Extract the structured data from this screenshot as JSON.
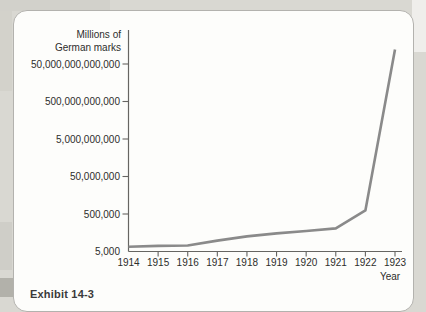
{
  "page": {
    "caption_fragment": "Exhibit 14-3"
  },
  "chart_data": {
    "type": "line",
    "title": "",
    "ylabel_line1": "Millions of",
    "ylabel_line2": "German marks",
    "xlabel": "Year",
    "y_scale": "log",
    "grid": false,
    "legend": "none",
    "x_tick_labels": [
      "1914",
      "1915",
      "1916",
      "1917",
      "1918",
      "1919",
      "1920",
      "1921",
      "1922",
      "1923"
    ],
    "y_ticks": [
      {
        "label": "50,000,000,000,000",
        "value": 50000000000000
      },
      {
        "label": "500,000,000,000",
        "value": 500000000000
      },
      {
        "label": "5,000,000,000",
        "value": 5000000000
      },
      {
        "label": "50,000,000",
        "value": 50000000
      },
      {
        "label": "500,000",
        "value": 500000
      },
      {
        "label": "5,000",
        "value": 5000
      }
    ],
    "x": [
      1914,
      1915,
      1916,
      1917,
      1918,
      1919,
      1920,
      1921,
      1922,
      1923
    ],
    "values": [
      9000,
      10000,
      10500,
      19000,
      32000,
      46000,
      62000,
      85000,
      775000,
      300000000000000
    ],
    "ylim": [
      5000,
      500000000000000
    ],
    "line_color": "#8a8a8a",
    "axis_color": "#666562",
    "text_color": "#2d2d2b"
  }
}
